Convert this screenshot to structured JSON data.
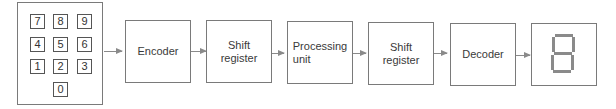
{
  "keypad": {
    "keys": [
      "7",
      "8",
      "9",
      "4",
      "5",
      "6",
      "1",
      "2",
      "3",
      "0"
    ]
  },
  "blocks": [
    {
      "label": "Encoder"
    },
    {
      "label": "Shift\nregister"
    },
    {
      "label": "Processing\nunit"
    },
    {
      "label": "Shift\nregister"
    },
    {
      "label": "Decoder"
    }
  ],
  "display": {
    "digit": "8",
    "description": "seven-segment display"
  }
}
